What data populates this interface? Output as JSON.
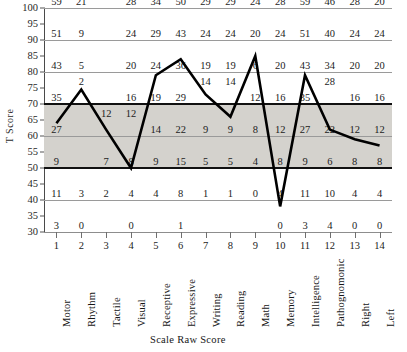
{
  "chart_data": {
    "type": "line",
    "title": "",
    "xlabel": "Scale Raw Score",
    "ylabel": "T Score",
    "ylim": [
      30,
      100
    ],
    "yticks": [
      100,
      95,
      90,
      85,
      80,
      75,
      70,
      65,
      60,
      55,
      50,
      45,
      40,
      35,
      30
    ],
    "grid": true,
    "shaded_band": [
      50,
      70
    ],
    "major_lines": [
      70,
      50
    ],
    "categories": [
      "Motor",
      "Rhythm",
      "Tactile",
      "Visual",
      "Receptive",
      "Expressive",
      "Writing",
      "Reading",
      "Math",
      "Memory",
      "Intelligence",
      "Pathognomonic",
      "Right",
      "Left"
    ],
    "column_numbers": [
      1,
      2,
      3,
      4,
      5,
      6,
      7,
      8,
      9,
      10,
      11,
      12,
      13,
      14
    ],
    "series": [
      {
        "name": "T Score profile",
        "values": [
          64,
          74.5,
          62,
          50,
          79,
          84,
          73,
          66,
          85,
          38,
          79,
          62,
          59,
          57
        ]
      }
    ],
    "raw_score_rows": [
      {
        "t": 100,
        "values": [
          "59",
          "21",
          "",
          "28",
          "34",
          "50",
          "29",
          "29",
          "24",
          "28",
          "59",
          "46",
          "28",
          "20"
        ]
      },
      {
        "t": 90,
        "values": [
          "51",
          "9",
          "",
          "24",
          "29",
          "43",
          "24",
          "24",
          "20",
          "24",
          "51",
          "40",
          "24",
          "24"
        ]
      },
      {
        "t": 80,
        "values": [
          "43",
          "5",
          "",
          "20",
          "24",
          "36",
          "19",
          "19",
          "6",
          "20",
          "43",
          "34",
          "20",
          "20"
        ]
      },
      {
        "t": 75,
        "values": [
          "",
          "2",
          "",
          "",
          "",
          "",
          "14",
          "14",
          "",
          "",
          "",
          "28",
          "",
          ""
        ]
      },
      {
        "t": 70,
        "values": [
          "35",
          "",
          "",
          "16",
          "19",
          "29",
          "",
          "",
          "12",
          "16",
          "35",
          "",
          "16",
          "16"
        ]
      },
      {
        "t": 65,
        "values": [
          "",
          "",
          "12",
          "12",
          "",
          "",
          "",
          "",
          "",
          "",
          "",
          "",
          "",
          ""
        ]
      },
      {
        "t": 60,
        "values": [
          "27",
          "",
          "",
          "",
          "14",
          "22",
          "9",
          "9",
          "8",
          "12",
          "27",
          "22",
          "12",
          "12"
        ]
      },
      {
        "t": 50,
        "values": [
          "9",
          "",
          "7",
          "8",
          "9",
          "15",
          "5",
          "5",
          "4",
          "8",
          "9",
          "6",
          "8",
          "8"
        ]
      },
      {
        "t": 40,
        "values": [
          "11",
          "3",
          "2",
          "4",
          "4",
          "8",
          "1",
          "1",
          "0",
          "4",
          "11",
          "10",
          "4",
          "4"
        ]
      },
      {
        "t": 30,
        "values": [
          "3",
          "0",
          "",
          "0",
          "",
          "1",
          "",
          "",
          "",
          "0",
          "3",
          "4",
          "0",
          "0"
        ]
      }
    ]
  }
}
